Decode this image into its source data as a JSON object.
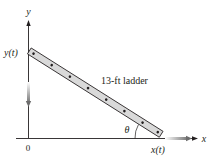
{
  "diagram": {
    "axes": {
      "x_label": "x",
      "y_label": "y",
      "origin_label": "0"
    },
    "ladder": {
      "label": "13-ft ladder",
      "top_label": "y(t)",
      "bottom_label": "x(t)",
      "angle_label": "θ",
      "dots": 8,
      "fill_color": "#d9d9d9",
      "stroke_color": "#231f20"
    },
    "motion_arrows": {
      "top": "down",
      "bottom": "right",
      "color": "#8a8a8a"
    }
  }
}
